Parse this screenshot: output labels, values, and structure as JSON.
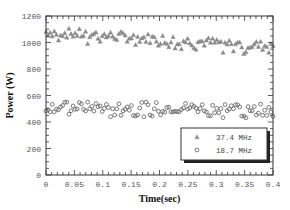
{
  "chart_data": {
    "type": "scatter",
    "title": "",
    "xlabel": "Time(sec)",
    "ylabel": "Power (W)",
    "xlim": [
      0,
      0.4
    ],
    "ylim": [
      0,
      1200
    ],
    "xticks": [
      0,
      0.05,
      0.1,
      0.15,
      0.2,
      0.25,
      0.3,
      0.35,
      0.4
    ],
    "xtick_labels": [
      "0",
      "0.05",
      "0.1",
      "0.15",
      "0.2",
      "0.25",
      "0.3",
      "0.35",
      "0.4"
    ],
    "yticks": [
      0,
      200,
      400,
      600,
      800,
      1000,
      1200
    ],
    "ytick_labels": [
      "0",
      "200",
      "400",
      "600",
      "800",
      "1000",
      "1200"
    ],
    "grid": false,
    "legend_position": "bottom-right",
    "series": [
      {
        "name": "37.4 MHz",
        "marker": "triangle",
        "color": "#8a8a8a",
        "trend": {
          "start": [
            0.0,
            1085
          ],
          "end": [
            0.4,
            975
          ]
        },
        "noise_range": [
          -40,
          35
        ]
      },
      {
        "name": "18.7 MHz",
        "marker": "circle",
        "color": "#6a6a6a",
        "trend": {
          "start": [
            0.0,
            525
          ],
          "end": [
            0.4,
            515
          ]
        },
        "noise_range": [
          -50,
          30
        ]
      }
    ]
  }
}
